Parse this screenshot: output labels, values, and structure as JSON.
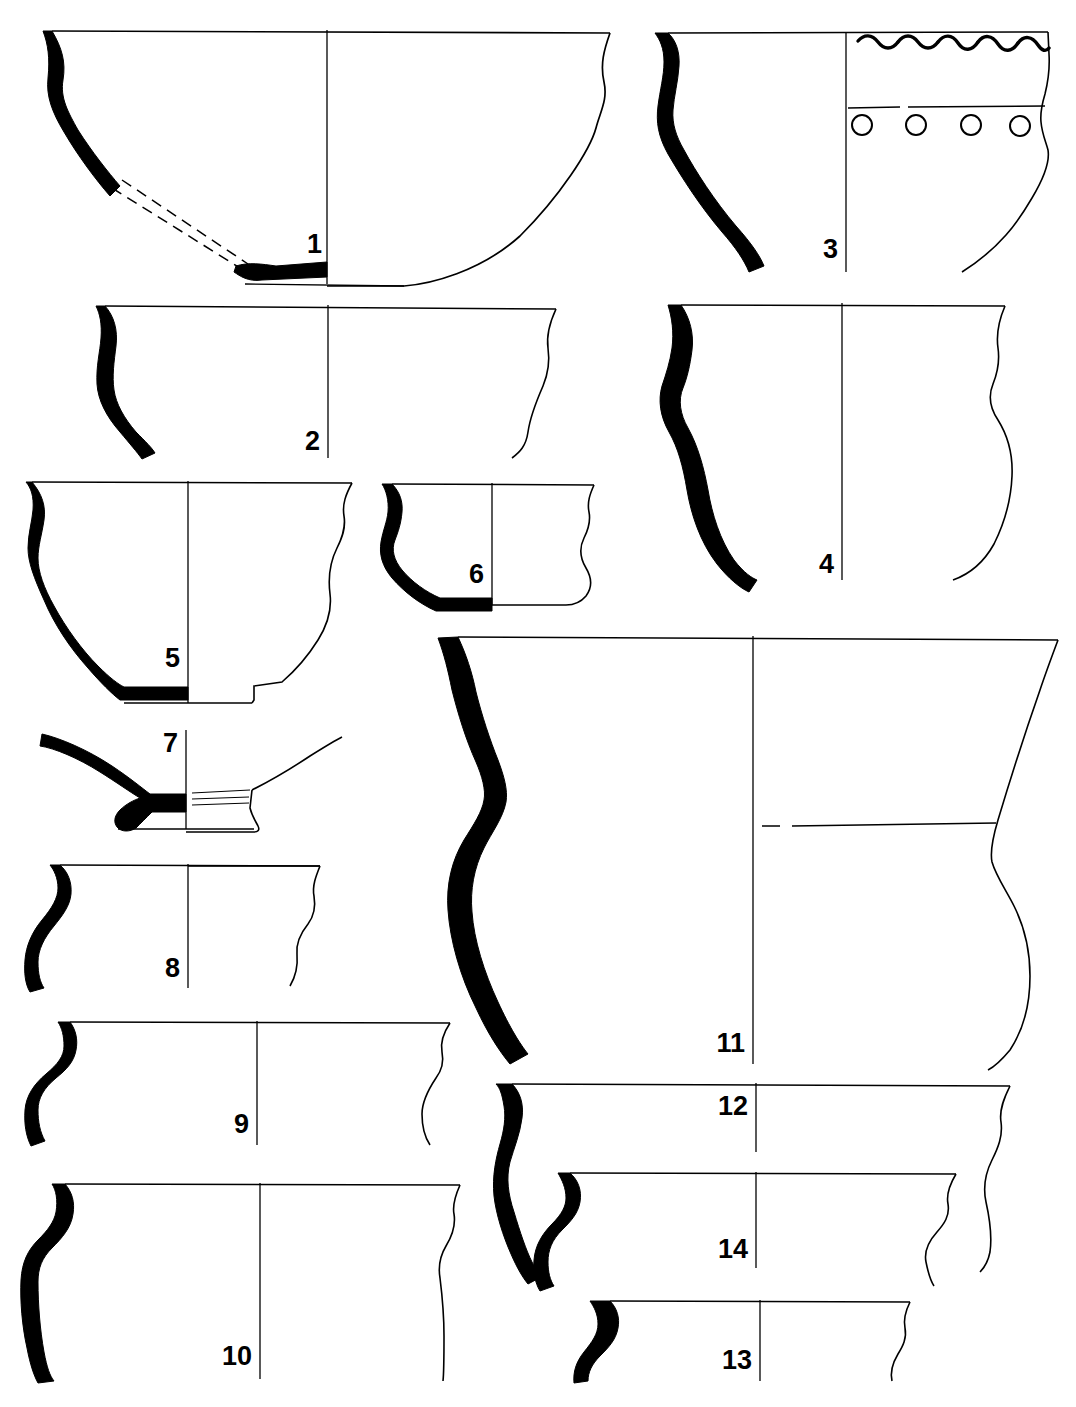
{
  "plate": {
    "title": "Ceramic vessel profile plate",
    "caption": "",
    "figure_count": 14,
    "ink_color": "#000000",
    "background_color": "#ffffff",
    "label_color": "#000000"
  },
  "vessels": [
    {
      "number": "1",
      "label": "1",
      "form": "large open bowl / basin with flat base",
      "label_x": 322,
      "label_y": 253,
      "label_size": 27,
      "axis": {
        "x": 327,
        "y1": 30,
        "y2": 284
      },
      "notes": "reconstructed wall shown with double dashed lines; rim diameter widest on plate"
    },
    {
      "number": "2",
      "label": "2",
      "form": "shallow bowl with S-profile rim",
      "label_x": 320,
      "label_y": 450,
      "label_size": 27,
      "axis": {
        "x": 328,
        "y1": 305,
        "y2": 458
      },
      "notes": ""
    },
    {
      "number": "3",
      "label": "3",
      "form": "jar with wavy-line rim decoration and row of circular punctates",
      "label_x": 838,
      "label_y": 258,
      "label_size": 27,
      "axis": {
        "x": 846,
        "y1": 32,
        "y2": 272
      },
      "decoration": {
        "wavy_band": {
          "count": 6,
          "position": "below rim"
        },
        "incised_line": {
          "count": 1,
          "position": "upper body"
        },
        "punctate_circles": {
          "count": 4,
          "position": "below incised line"
        }
      }
    },
    {
      "number": "4",
      "label": "4",
      "form": "tall jar with flaring rim and rounded body",
      "label_x": 834,
      "label_y": 573,
      "label_size": 27,
      "axis": {
        "x": 842,
        "y1": 303,
        "y2": 580
      },
      "notes": ""
    },
    {
      "number": "5",
      "label": "5",
      "form": "bowl on low footring base",
      "label_x": 180,
      "label_y": 667,
      "label_size": 27,
      "axis": {
        "x": 188,
        "y1": 481,
        "y2": 703
      },
      "notes": ""
    },
    {
      "number": "6",
      "label": "6",
      "form": "small bowl with everted rim",
      "label_x": 484,
      "label_y": 583,
      "label_size": 27,
      "axis": {
        "x": 492,
        "y1": 483,
        "y2": 605
      },
      "notes": ""
    },
    {
      "number": "7",
      "label": "7",
      "form": "base sherd: footring with flaring lower wall",
      "label_x": 178,
      "label_y": 752,
      "label_size": 27,
      "axis": {
        "x": 186,
        "y1": 730,
        "y2": 829
      },
      "notes": "fine horizontal lines incised above footring"
    },
    {
      "number": "8",
      "label": "8",
      "form": "rim sherd with pronounced S-profile",
      "label_x": 180,
      "label_y": 977,
      "label_size": 27,
      "axis": {
        "x": 188,
        "y1": 864,
        "y2": 988
      },
      "notes": ""
    },
    {
      "number": "9",
      "label": "9",
      "form": "wide jar with sharply everted S-rim",
      "label_x": 249,
      "label_y": 1133,
      "label_size": 27,
      "axis": {
        "x": 257,
        "y1": 1021,
        "y2": 1145
      },
      "notes": ""
    },
    {
      "number": "10",
      "label": "10",
      "form": "jar with everted rim and near-vertical body",
      "label_x": 252,
      "label_y": 1365,
      "label_size": 27,
      "axis": {
        "x": 260,
        "y1": 1183,
        "y2": 1379
      },
      "notes": ""
    },
    {
      "number": "11",
      "label": "11",
      "form": "large carinated jar with angular shoulder break",
      "label_x": 745,
      "label_y": 1052,
      "label_size": 27,
      "axis": {
        "x": 753,
        "y1": 636,
        "y2": 1064
      },
      "notes": "horizontal line marks carination on body"
    },
    {
      "number": "12",
      "label": "12",
      "form": "jar with everted rim and swelling body",
      "label_x": 748,
      "label_y": 1115,
      "label_size": 27,
      "axis": {
        "x": 756,
        "y1": 1083,
        "y2": 1152
      },
      "notes": "drawn overlapping vessel 14"
    },
    {
      "number": "13",
      "label": "13",
      "form": "small rim sherd with S-profile",
      "label_x": 752,
      "label_y": 1369,
      "label_size": 27,
      "axis": {
        "x": 760,
        "y1": 1300,
        "y2": 1381
      },
      "notes": ""
    },
    {
      "number": "14",
      "label": "14",
      "form": "jar with everted rim, nested with vessel 12",
      "label_x": 748,
      "label_y": 1258,
      "label_size": 27,
      "axis": {
        "x": 756,
        "y1": 1172,
        "y2": 1268
      },
      "notes": ""
    }
  ]
}
